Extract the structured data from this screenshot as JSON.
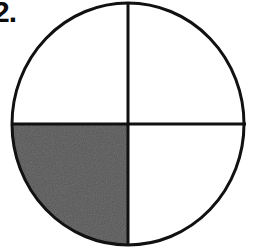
{
  "page": {
    "background_color": "#ffffff",
    "width": 256,
    "height": 250
  },
  "problem": {
    "label": "2.",
    "label_color": "#0d0d0d",
    "truncated_at_left_edge": true
  },
  "figure": {
    "name": "fraction-circle",
    "type": "circle-divided-into-quadrants",
    "outline_color": "#111111",
    "outline_width_px": 3,
    "divider_color": "#111111",
    "divider_width_px": 3,
    "unshaded_fill": "#ffffff",
    "shaded_fill": "#555555",
    "center_x": 128,
    "center_y": 124,
    "radius_x": 116,
    "radius_y": 121,
    "total_parts": 4,
    "shaded_parts": 1,
    "fraction_text": "1/4",
    "dividers": [
      {
        "name": "vertical-divider",
        "orientation": "vertical",
        "x": 128,
        "y_start": 3,
        "y_end": 245
      },
      {
        "name": "horizontal-divider",
        "orientation": "horizontal",
        "y": 124,
        "x_start": 11,
        "x_end": 246
      }
    ],
    "quadrants": [
      {
        "name": "top-left-quadrant",
        "position": "top-left",
        "shaded": false,
        "fill": "#ffffff"
      },
      {
        "name": "top-right-quadrant",
        "position": "top-right",
        "shaded": false,
        "fill": "#ffffff"
      },
      {
        "name": "bottom-left-quadrant",
        "position": "bottom-left",
        "shaded": true,
        "fill": "#555555"
      },
      {
        "name": "bottom-right-quadrant",
        "position": "bottom-right",
        "shaded": false,
        "fill": "#ffffff"
      }
    ]
  }
}
